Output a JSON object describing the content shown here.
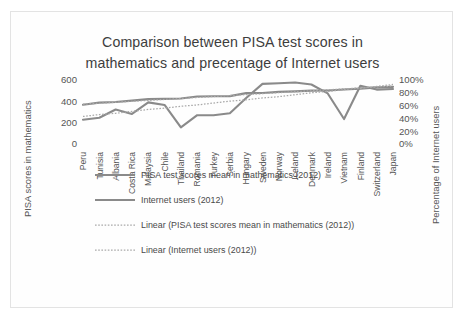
{
  "chart_data": {
    "type": "line",
    "title": "Comparison between PISA test scores in mathematics and precentage of Internet users",
    "title_line1": "Comparison between PISA test scores in",
    "title_line2": "mathematics and precentage of Internet users",
    "xlabel": "",
    "ylabel": "PISA scores in mathematics",
    "y2label": "Percentage of Internet users",
    "ylim": [
      0,
      600
    ],
    "y2lim": [
      0,
      100
    ],
    "yticks": [
      "600",
      "400",
      "200",
      "0"
    ],
    "ytick_values": [
      600,
      400,
      200,
      0
    ],
    "y2ticks": [
      "100%",
      "80%",
      "60%",
      "40%",
      "20%",
      "0%"
    ],
    "y2tick_values": [
      100,
      80,
      60,
      40,
      20,
      0
    ],
    "grid": false,
    "legend_position": "bottom-left",
    "categories": [
      "Peru",
      "Tunisia",
      "Albania",
      "Costa Rica",
      "Malaysia",
      "Chile",
      "Thailand",
      "Romania",
      "Turkey",
      "Serbia",
      "Hungary",
      "Sweden",
      "Norway",
      "Iceland",
      "Denmark",
      "Ireland",
      "Vietnam",
      "Finland",
      "Switzerland",
      "Japan"
    ],
    "series": [
      {
        "name": "PISA test scores mean in mathematics (2012)",
        "axis": "left",
        "style": "solid",
        "color": "#8a8a8a",
        "values": [
          368,
          388,
          394,
          407,
          421,
          423,
          427,
          445,
          448,
          449,
          477,
          478,
          489,
          493,
          500,
          501,
          511,
          519,
          531,
          536
        ]
      },
      {
        "name": "Internet users (2012)",
        "axis": "right",
        "style": "solid",
        "color": "#8a8a8a",
        "values": [
          38,
          41,
          54,
          47,
          65,
          61,
          26,
          45,
          45,
          48,
          72,
          94,
          95,
          96,
          93,
          79,
          39,
          91,
          85,
          86
        ]
      },
      {
        "name": "Linear (PISA test scores mean in mathematics (2012))",
        "axis": "left",
        "style": "dotted",
        "color": "#a9a9a9",
        "values": [
          373,
          382,
          391,
          400,
          409,
          418,
          427,
          436,
          445,
          454,
          463,
          472,
          481,
          490,
          499,
          508,
          517,
          526,
          535,
          544
        ]
      },
      {
        "name": "Linear (Internet users (2012))",
        "axis": "right",
        "style": "dotted",
        "color": "#a9a9a9",
        "values": [
          43,
          46,
          48,
          51,
          54,
          56,
          59,
          61,
          64,
          67,
          69,
          72,
          74,
          77,
          80,
          82,
          85,
          87,
          90,
          93
        ]
      }
    ],
    "legend": [
      {
        "label": "PISA test scores mean in mathematics (2012)",
        "style": "solid",
        "color": "#8a8a8a"
      },
      {
        "label": "Internet users (2012)",
        "style": "solid",
        "color": "#8a8a8a"
      },
      {
        "label": "Linear (PISA test scores mean in mathematics (2012))",
        "style": "dotted",
        "color": "#a9a9a9"
      },
      {
        "label": "Linear (Internet users (2012))",
        "style": "dotted",
        "color": "#a9a9a9"
      }
    ]
  }
}
